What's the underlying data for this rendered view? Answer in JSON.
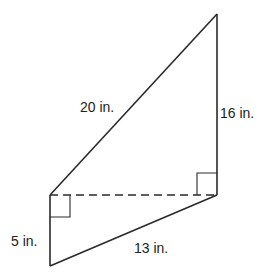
{
  "diagram": {
    "type": "geometry-figure",
    "stroke_color": "#2a2a2a",
    "vertices": {
      "top": [
        217,
        14
      ],
      "right": [
        217,
        195
      ],
      "left": [
        50,
        195
      ],
      "bottom": [
        50,
        266
      ]
    },
    "labels": {
      "hypotenuse_top": "20 in.",
      "right_vertical": "16 in.",
      "left_vertical": "5 in.",
      "bottom_slant": "13 in."
    },
    "right_angle_markers": [
      "at left vertex (between left vertical and dashed line)",
      "at right vertex (between right vertical and dashed line)"
    ],
    "dashed_segment": "connects left vertex to right vertex"
  }
}
